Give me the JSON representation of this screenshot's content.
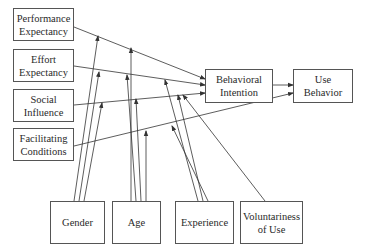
{
  "constructs": {
    "performance_expectancy": "Performance Expectancy",
    "effort_expectancy": "Effort Expectancy",
    "social_influence": "Social Influence",
    "facilitating_conditions": "Facilitating Conditions",
    "behavioral_intention": "Behavioral Intention",
    "use_behavior": "Use Behavior"
  },
  "moderators": {
    "gender": "Gender",
    "age": "Age",
    "experience": "Experience",
    "voluntariness": "Voluntariness of Use"
  },
  "edges": [
    {
      "from": "Performance Expectancy",
      "to": "Behavioral Intention"
    },
    {
      "from": "Effort Expectancy",
      "to": "Behavioral Intention"
    },
    {
      "from": "Social Influence",
      "to": "Behavioral Intention"
    },
    {
      "from": "Behavioral Intention",
      "to": "Use Behavior"
    },
    {
      "from": "Facilitating Conditions",
      "to": "Use Behavior"
    },
    {
      "from": "Gender",
      "moderates": [
        "PE->BI",
        "EE->BI",
        "SI->BI"
      ]
    },
    {
      "from": "Age",
      "moderates": [
        "PE->BI",
        "EE->BI",
        "SI->BI",
        "FC->UB"
      ]
    },
    {
      "from": "Experience",
      "moderates": [
        "EE->BI",
        "SI->BI",
        "FC->UB"
      ]
    },
    {
      "from": "Voluntariness of Use",
      "moderates": [
        "SI->BI"
      ]
    }
  ],
  "colors": {
    "line": "#333333",
    "border": "#555555",
    "background": "#ffffff"
  }
}
